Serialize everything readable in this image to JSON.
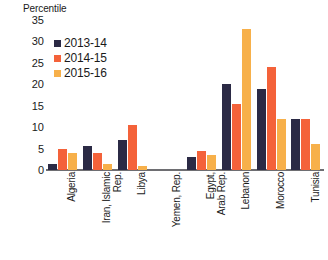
{
  "chart_data": {
    "type": "bar",
    "title": "",
    "subtitle": "",
    "xlabel": "",
    "ylabel": "Percentile",
    "ylim": [
      0,
      35
    ],
    "ytick_labels": [
      "35",
      "30",
      "25",
      "20",
      "15",
      "10",
      "5",
      "0"
    ],
    "ytick_values": [
      35,
      30,
      25,
      20,
      15,
      10,
      5,
      0
    ],
    "grid": false,
    "legend_position": "top-left",
    "categories": [
      "Algeria",
      "Iran, Islamic\nRep.",
      "Libya",
      "Yemen, Rep.",
      "Egypt,\nArab Rep.",
      "Lebanon",
      "Morocco",
      "Tunisia"
    ],
    "series": [
      {
        "name": "2013-14",
        "color": "#2b2a45",
        "values": [
          1.5,
          5.5,
          7.0,
          0.0,
          3.0,
          20.0,
          19.0,
          12.0
        ]
      },
      {
        "name": "2014-15",
        "color": "#f4623a",
        "values": [
          5.0,
          4.0,
          10.5,
          0.0,
          4.5,
          15.5,
          24.0,
          12.0
        ]
      },
      {
        "name": "2015-16",
        "color": "#f7b04a",
        "values": [
          4.0,
          1.5,
          1.0,
          0.0,
          3.5,
          33.0,
          12.0,
          6.0
        ]
      }
    ]
  },
  "legend": {
    "items": [
      {
        "label": "2013-14",
        "color": "#2b2a45"
      },
      {
        "label": "2014-15",
        "color": "#f4623a"
      },
      {
        "label": "2015-16",
        "color": "#f7b04a"
      }
    ]
  },
  "axis": {
    "y_title": "Percentile"
  }
}
